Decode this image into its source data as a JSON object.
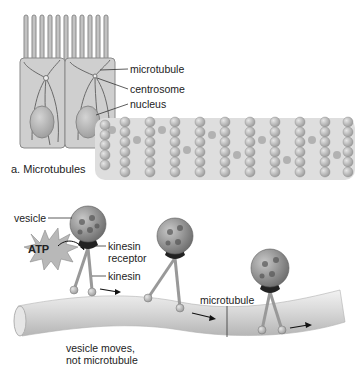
{
  "panel_a": {
    "caption": "a. Microtubules",
    "labels": {
      "microtubule": "microtubule",
      "centrosome": "centrosome",
      "nucleus": "nucleus"
    }
  },
  "panel_b": {
    "labels": {
      "vesicle": "vesicle",
      "atp": "ATP",
      "kinesin_receptor_1": "kinesin",
      "kinesin_receptor_2": "receptor",
      "kinesin": "kinesin",
      "microtubule": "microtubule",
      "note_1": "vesicle moves,",
      "note_2": "not microtubule"
    }
  }
}
